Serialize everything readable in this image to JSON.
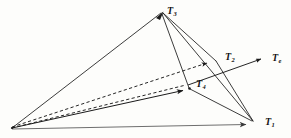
{
  "figure": {
    "type": "vector-tetrahedron-diagram",
    "background_color": "#fdfdfb",
    "stroke_color": "#1a1a1a",
    "baseline_color": "#6e6e6e",
    "labels": {
      "t1": {
        "base": "T",
        "sub": "1"
      },
      "t2": {
        "base": "T",
        "sub": "2"
      },
      "t3": {
        "base": "T",
        "sub": "3"
      },
      "t4": {
        "base": "T",
        "sub": "4"
      },
      "te": {
        "base": "T",
        "sub": "e"
      }
    },
    "vertices": {
      "origin": [
        12,
        128
      ],
      "t1": [
        254,
        122
      ],
      "t2": [
        215,
        60
      ],
      "t3": [
        162,
        12
      ],
      "t4": [
        189,
        88
      ],
      "te_tip": [
        268,
        58
      ]
    },
    "vectors": [
      {
        "name": "T1",
        "from": "origin",
        "to": "t1",
        "style": "solid",
        "arrow": true
      },
      {
        "name": "T2",
        "from": "origin",
        "to": "t2",
        "style": "dashed",
        "arrow": true
      },
      {
        "name": "T3",
        "from": "origin",
        "to": "t3",
        "style": "solid",
        "arrow": true
      },
      {
        "name": "T4",
        "from": "origin",
        "to": "t4",
        "style": "solid",
        "arrow": true
      },
      {
        "name": "Te",
        "from": "origin",
        "to": "te_tip",
        "style": "dashed-solid",
        "arrow": true
      }
    ],
    "edges": [
      {
        "from": "t3",
        "to": "t1",
        "style": "solid"
      },
      {
        "from": "t3",
        "to": "t2",
        "style": "solid"
      },
      {
        "from": "t3",
        "to": "t4",
        "style": "solid"
      },
      {
        "from": "t2",
        "to": "t1",
        "style": "solid"
      },
      {
        "from": "t4",
        "to": "t1",
        "style": "solid"
      }
    ]
  }
}
